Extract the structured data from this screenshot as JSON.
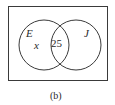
{
  "diagram": {
    "type": "venn",
    "sets": [
      {
        "label": "E",
        "region_value": "x"
      },
      {
        "label": "J",
        "region_value": ""
      }
    ],
    "intersection_value": "25",
    "caption": "(b)",
    "colors": {
      "stroke": "#3a3a3a",
      "background": "#ffffff"
    }
  }
}
